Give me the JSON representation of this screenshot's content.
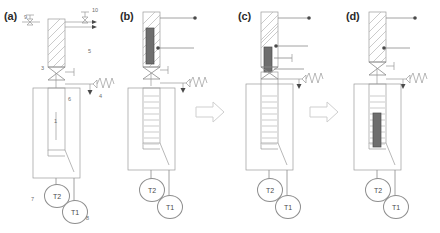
{
  "figure": {
    "type": "scientific-apparatus-schematic",
    "panels": [
      {
        "id": "a",
        "label": "(a)",
        "caption_label": "(a)",
        "has_plug": false,
        "plug_position": "none",
        "callouts": [
          "9",
          "10",
          "5",
          "3",
          "4",
          "6",
          "1",
          "7",
          "8"
        ]
      },
      {
        "id": "b",
        "label": "(b)",
        "caption_label": "(b)",
        "has_plug": true,
        "plug_position": "upper-tube-top",
        "callouts": []
      },
      {
        "id": "c",
        "label": "(c)",
        "caption_label": "(c)",
        "has_plug": true,
        "plug_position": "upper-tube-bottom-at-valve",
        "callouts": []
      },
      {
        "id": "d",
        "label": "(d)",
        "caption_label": "(d)",
        "has_plug": true,
        "plug_position": "inner-tube-lower",
        "callouts": []
      }
    ],
    "transition_arrows": [
      {
        "from": "b",
        "to": "c",
        "glyph": "block-arrow-right"
      },
      {
        "from": "c",
        "to": "d",
        "glyph": "block-arrow-right"
      }
    ],
    "component_numbers": {
      "1": "inner sample tube",
      "3": "isolation valve",
      "4": "vacuum / gas connection",
      "5": "upper loading tube",
      "6": "outer vessel / jacket",
      "7": "thermocouple T2",
      "8": "thermocouple T1",
      "9": "left valve",
      "10": "right valve with outlet lines"
    },
    "sensors": [
      {
        "name": "T2",
        "number": "7"
      },
      {
        "name": "T1",
        "number": "8"
      }
    ],
    "labels": {
      "t2": "T2",
      "t1": "T1",
      "n1": "1",
      "n3": "3",
      "n4": "4",
      "n5": "5",
      "n6": "6",
      "n7": "7",
      "n8": "8",
      "n9": "9",
      "n10": "10"
    }
  }
}
